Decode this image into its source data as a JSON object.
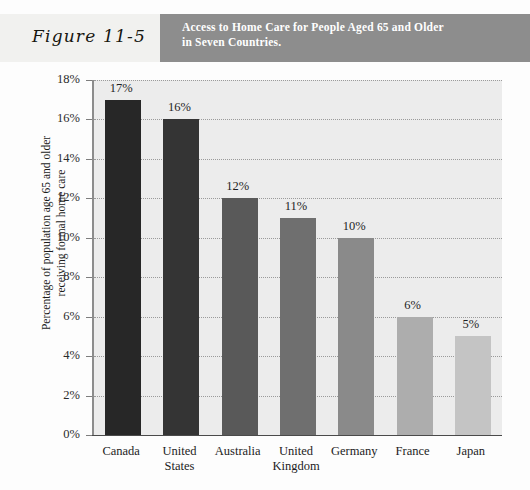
{
  "figure": {
    "label": "Figure 11-5",
    "title_line1": "Access to Home Care for People Aged 65 and Older",
    "title_line2": "in Seven Countries.",
    "title_band_color": "#8d8d8d",
    "header_band_color": "#f1f1ef"
  },
  "chart_data": {
    "type": "bar",
    "title": "Access to Home Care for People Aged 65 and Older in Seven Countries.",
    "categories": [
      "Canada",
      "United States",
      "Australia",
      "United Kingdom",
      "Germany",
      "France",
      "Japan"
    ],
    "values": [
      17,
      16,
      12,
      11,
      10,
      6,
      5
    ],
    "data_labels": [
      "17%",
      "16%",
      "12%",
      "11%",
      "10%",
      "6%",
      "5%"
    ],
    "bar_colors": [
      "#272727",
      "#343434",
      "#595959",
      "#6f6f6f",
      "#8a8a8a",
      "#adadad",
      "#c4c4c4"
    ],
    "xlabel": "",
    "ylabel": "Percentage of population age 65 and older receiving formal home care",
    "ylabel_line1": "Percentage of population age 65 and older",
    "ylabel_line2": "receiving formal home care",
    "ylim": [
      0,
      18
    ],
    "ytick_values": [
      0,
      2,
      4,
      6,
      8,
      10,
      12,
      14,
      16,
      18
    ],
    "ytick_labels": [
      "0%",
      "2%",
      "4%",
      "6%",
      "8%",
      "10%",
      "12%",
      "14%",
      "16%",
      "18%"
    ],
    "grid": true,
    "gridline_style": "dotted",
    "legend": false,
    "plot_background": "#ececec",
    "units": "percent"
  }
}
